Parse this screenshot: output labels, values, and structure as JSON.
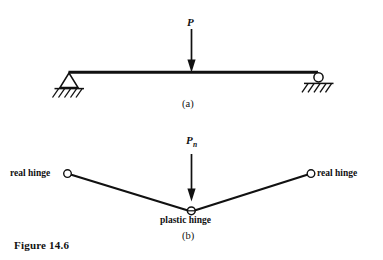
{
  "figure": {
    "caption": "Figure 14.6",
    "background_color": "#ffffff",
    "ink_color": "#111111"
  },
  "diagram_data": {
    "type": "engineering-diagram",
    "subject": "Simply supported beam with central point load and its plastic collapse mechanism",
    "panels": [
      {
        "id": "a",
        "label": "(a)",
        "description": "Simply supported beam with concentrated load P at midspan",
        "load": {
          "symbol": "P",
          "subscript": "",
          "direction": "down"
        },
        "supports": [
          {
            "type": "pin",
            "position": "left",
            "hatched_ground": true
          },
          {
            "type": "roller",
            "position": "right",
            "hatched_ground": true
          }
        ],
        "member": {
          "shape": "straight-horizontal-beam"
        }
      },
      {
        "id": "b",
        "label": "(b)",
        "description": "Collapse mechanism: two rigid links forming a V, rotating about real hinges at the ends and a plastic hinge at midspan",
        "load": {
          "symbol": "P",
          "subscript": "n",
          "direction": "down"
        },
        "hinges": [
          {
            "kind": "real",
            "label": "real hinge",
            "position": "left"
          },
          {
            "kind": "plastic",
            "label": "plastic hinge",
            "position": "center"
          },
          {
            "kind": "real",
            "label": "real hinge",
            "position": "right"
          }
        ],
        "member": {
          "shape": "V-shaped two-link mechanism"
        }
      }
    ]
  }
}
